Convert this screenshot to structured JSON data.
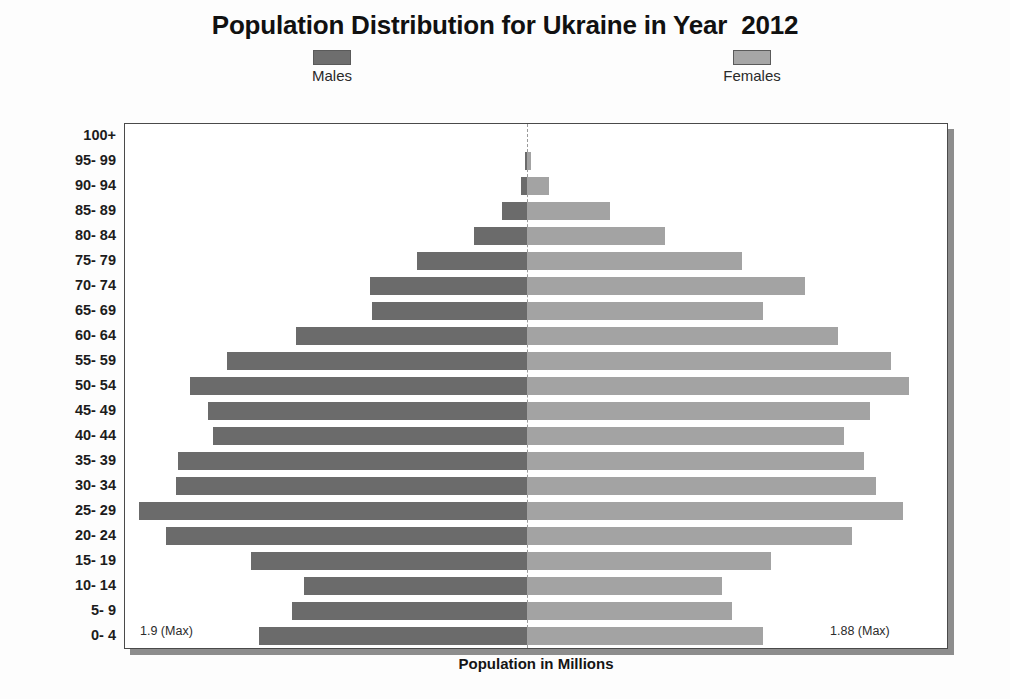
{
  "header": {
    "title": "Population Distribution for Ukraine in Year  2012"
  },
  "legend": {
    "position": "top",
    "items": [
      {
        "label": "Males",
        "color": "#6b6b6b",
        "swatch_name": "male-swatch"
      },
      {
        "label": "Females",
        "color": "#a3a3a3",
        "swatch_name": "female-swatch"
      }
    ]
  },
  "annotations": {
    "max_left": "1.9 (Max)",
    "max_right": "1.88 (Max)"
  },
  "axes": {
    "x_title": "Population in Millions",
    "y_title": ""
  },
  "chart_data": {
    "type": "bar",
    "subtype": "population-pyramid",
    "title": "Population Distribution for Ukraine in Year  2012",
    "xlabel": "Population in Millions",
    "ylabel": "",
    "grid": false,
    "legend_position": "top",
    "orientation": "horizontal-diverging",
    "xlim": [
      -1.9,
      1.88
    ],
    "max_male": 1.9,
    "max_female": 1.88,
    "categories": [
      "100+",
      "95- 99",
      "90- 94",
      "85- 89",
      "80- 84",
      "75- 79",
      "70- 74",
      "65- 69",
      "60- 64",
      "55- 59",
      "50- 54",
      "45- 49",
      "40- 44",
      "35- 39",
      "30- 34",
      "25- 29",
      "20- 24",
      "15- 19",
      "10- 14",
      "5- 9",
      "0- 4"
    ],
    "series": [
      {
        "name": "Males",
        "color": "#6b6b6b",
        "values": [
          0.0,
          0.01,
          0.03,
          0.12,
          0.26,
          0.54,
          0.77,
          0.76,
          1.13,
          1.47,
          1.65,
          1.56,
          1.54,
          1.71,
          1.72,
          1.9,
          1.77,
          1.35,
          1.09,
          1.15,
          1.31
        ]
      },
      {
        "name": "Females",
        "color": "#a3a3a3",
        "values": [
          0.0,
          0.02,
          0.11,
          0.41,
          0.68,
          1.06,
          1.37,
          1.16,
          1.53,
          1.79,
          1.88,
          1.69,
          1.56,
          1.66,
          1.72,
          1.85,
          1.6,
          1.2,
          0.96,
          1.01,
          1.16
        ]
      }
    ]
  }
}
